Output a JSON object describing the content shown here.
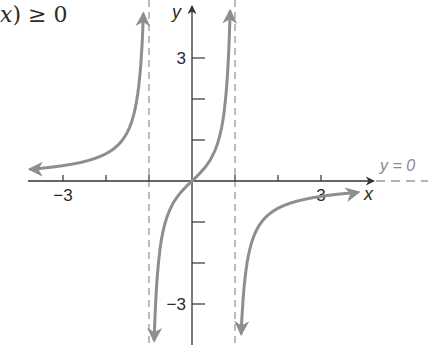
{
  "page": {
    "fragment_text": {
      "var": "x",
      "rest": ") ≥ 0"
    }
  },
  "colors": {
    "axis": "#333333",
    "curve": "#8e8e8e",
    "asymptote": "#9a9a9a",
    "text": "#2a2a2a",
    "asymptote_label": "#8a8a8a"
  },
  "chart_data": {
    "type": "line",
    "title": "",
    "function": "f(x) = x / (1 - x^2)",
    "xlabel": "x",
    "ylabel": "y",
    "xlim": [
      -4.45,
      5.5
    ],
    "ylim": [
      -4.0,
      4.4
    ],
    "x_ticks": [
      -3,
      -2,
      -1,
      1,
      2,
      3
    ],
    "y_ticks": [
      -3,
      -2,
      -1,
      1,
      2,
      3
    ],
    "x_tick_labels": [
      {
        "value": -3,
        "label": "−3"
      },
      {
        "value": 3,
        "label": "3"
      }
    ],
    "y_tick_labels": [
      {
        "value": 3,
        "label": "3"
      },
      {
        "value": -3,
        "label": "−3"
      }
    ],
    "grid": false,
    "vertical_asymptotes": [
      -1,
      1
    ],
    "horizontal_asymptote": {
      "y": 0,
      "label": "y = 0"
    },
    "series": [
      {
        "name": "left branch (x < -1)",
        "x": [
          -3.75,
          -3,
          -2.5,
          -2,
          -1.5,
          -1.25,
          -1.15,
          -1.1
        ],
        "y": [
          0.29,
          0.375,
          0.476,
          0.667,
          1.2,
          2.22,
          3.56,
          5.24
        ],
        "arrows": "both ends"
      },
      {
        "name": "middle branch (-1 < x < 1)",
        "x": [
          -0.9,
          -0.8,
          -0.6,
          -0.4,
          -0.2,
          0,
          0.2,
          0.4,
          0.6,
          0.8,
          0.9
        ],
        "y": [
          -4.74,
          -2.22,
          -0.94,
          -0.476,
          -0.208,
          0,
          0.208,
          0.476,
          0.94,
          2.22,
          4.74
        ],
        "arrows": "both ends"
      },
      {
        "name": "right branch (x > 1)",
        "x": [
          1.08,
          1.15,
          1.25,
          1.5,
          2,
          2.5,
          3,
          3.85
        ],
        "y": [
          -6.5,
          -3.56,
          -2.22,
          -1.2,
          -0.667,
          -0.476,
          -0.375,
          -0.28
        ],
        "arrows": "both ends"
      }
    ]
  }
}
